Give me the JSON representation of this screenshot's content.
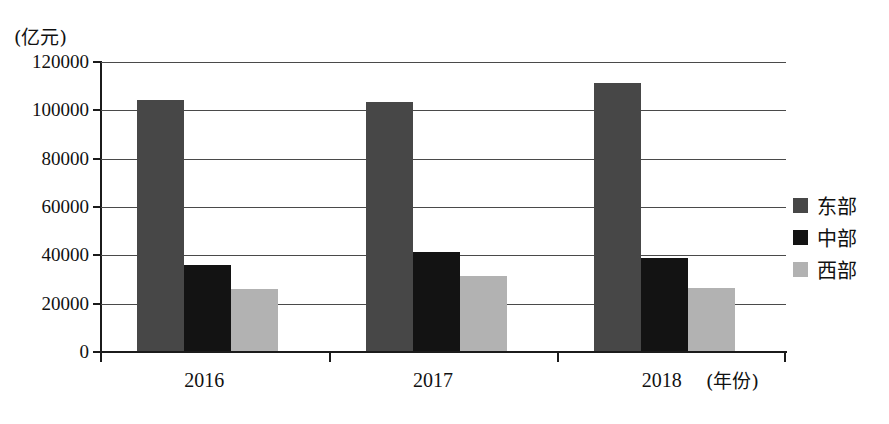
{
  "chart_data": {
    "type": "bar",
    "title": "",
    "subtitle": "",
    "xlabel": "(年份)",
    "ylabel": "(亿元)",
    "categories": [
      "2016",
      "2017",
      "2018"
    ],
    "series": [
      {
        "name": "东部",
        "color": "#474747",
        "values": [
          104000,
          103000,
          111000
        ]
      },
      {
        "name": "中部",
        "color": "#131313",
        "values": [
          35500,
          41000,
          38500
        ]
      },
      {
        "name": "西部",
        "color": "#b2b2b2",
        "values": [
          25500,
          31000,
          26000
        ]
      }
    ],
    "ylim": [
      0,
      120000
    ],
    "ytick_values": [
      0,
      20000,
      40000,
      60000,
      80000,
      100000,
      120000
    ],
    "ytick_labels": [
      "0",
      "20000",
      "40000",
      "60000",
      "80000",
      "100000",
      "120000"
    ],
    "grid": true,
    "legend_position": "right"
  },
  "legend": {
    "items": [
      {
        "label": "东部",
        "color": "#474747"
      },
      {
        "label": "中部",
        "color": "#131313"
      },
      {
        "label": "西部",
        "color": "#b2b2b2"
      }
    ]
  }
}
